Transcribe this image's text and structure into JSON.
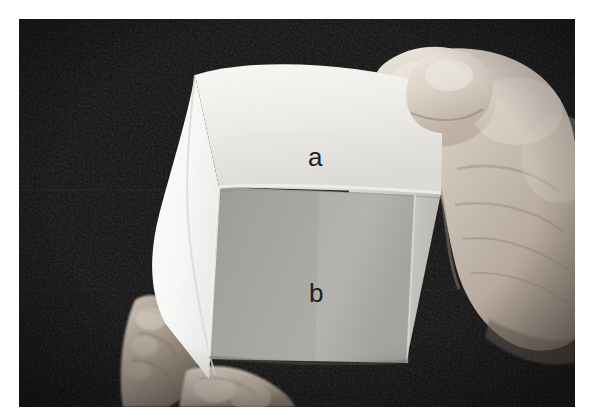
{
  "figure": {
    "kind": "photograph",
    "background_color": "#0a0a0a",
    "border_color": "#ffffff",
    "labels": [
      {
        "id": "a",
        "text": "a",
        "face": "top-white-face",
        "color": "#232323"
      },
      {
        "id": "b",
        "text": "b",
        "face": "front-gray-face",
        "color": "#1e1e1e"
      }
    ],
    "surfaces": {
      "top_face_color": "#f2f0ec",
      "front_face_color": "#a8a8a4",
      "left_flap_color": "#fbfbf9",
      "skin_color": "#c9bdb2"
    }
  }
}
